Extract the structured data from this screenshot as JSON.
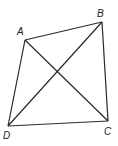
{
  "diagram": {
    "type": "quadrilateral-with-diagonals",
    "points": {
      "A": {
        "x": 25,
        "y": 40,
        "label": "A",
        "lx": 17,
        "ly": 35
      },
      "B": {
        "x": 102,
        "y": 22,
        "label": "B",
        "lx": 97,
        "ly": 17
      },
      "C": {
        "x": 108,
        "y": 121,
        "label": "C",
        "lx": 104,
        "ly": 135
      },
      "D": {
        "x": 8,
        "y": 126,
        "label": "D",
        "lx": 3,
        "ly": 139
      }
    },
    "edges": [
      [
        "A",
        "B"
      ],
      [
        "B",
        "C"
      ],
      [
        "C",
        "D"
      ],
      [
        "D",
        "A"
      ]
    ],
    "diagonals": [
      [
        "A",
        "C"
      ],
      [
        "B",
        "D"
      ]
    ],
    "stroke_color": "#2a2a2a"
  }
}
